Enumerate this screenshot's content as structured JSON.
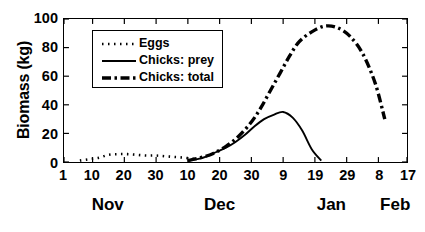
{
  "chart_data": {
    "type": "line",
    "title": "",
    "xlabel": "",
    "ylabel": "Biomass (kg)",
    "ylim": [
      0,
      100
    ],
    "yticks": [
      0,
      20,
      40,
      60,
      80,
      100
    ],
    "ytick_labels": [
      "0",
      "20",
      "40",
      "60",
      "80",
      "100"
    ],
    "xlim": [
      0,
      108
    ],
    "xtick_labels": [
      "1",
      "10",
      "20",
      "30",
      "10",
      "20",
      "30",
      "9",
      "19",
      "29",
      "8",
      "17"
    ],
    "xtick_positions": [
      0,
      9,
      19,
      29,
      39,
      49,
      59,
      69,
      79,
      89,
      99,
      108
    ],
    "month_labels": [
      "Nov",
      "Dec",
      "Jan",
      "Feb"
    ],
    "month_positions": [
      14,
      49,
      84,
      104
    ],
    "grid": false,
    "legend_position": "upper left",
    "series": [
      {
        "name": "Eggs",
        "style": "dotted",
        "x": [
          5,
          8,
          11,
          14,
          17,
          20,
          23,
          26,
          29,
          32,
          35,
          38,
          41
        ],
        "y": [
          1,
          2,
          3,
          5,
          5.5,
          5.5,
          5,
          4.5,
          4.5,
          4,
          3.5,
          3,
          2
        ]
      },
      {
        "name": "Chicks: prey",
        "style": "solid",
        "x": [
          39,
          42,
          45,
          48,
          51,
          54,
          57,
          60,
          63,
          66,
          69,
          72,
          75,
          78,
          81
        ],
        "y": [
          1,
          2,
          4,
          7,
          10,
          14,
          19,
          25,
          30,
          33,
          35,
          31,
          22,
          9,
          1
        ]
      },
      {
        "name": "Chicks: total",
        "style": "dashdot",
        "x": [
          39,
          43,
          47,
          51,
          55,
          59,
          62,
          65,
          68,
          71,
          74,
          78,
          82,
          86,
          90,
          94,
          98,
          101
        ],
        "y": [
          1,
          3,
          6,
          11,
          18,
          28,
          38,
          50,
          62,
          74,
          84,
          91,
          95,
          94,
          88,
          76,
          55,
          30
        ]
      }
    ]
  },
  "legend": {
    "items": [
      {
        "label": "Eggs",
        "style": "dotted"
      },
      {
        "label": "Chicks: prey",
        "style": "solid"
      },
      {
        "label": "Chicks: total",
        "style": "dashdot"
      }
    ]
  },
  "colors": {
    "line": "#000000",
    "axis": "#000000",
    "background": "#ffffff"
  }
}
